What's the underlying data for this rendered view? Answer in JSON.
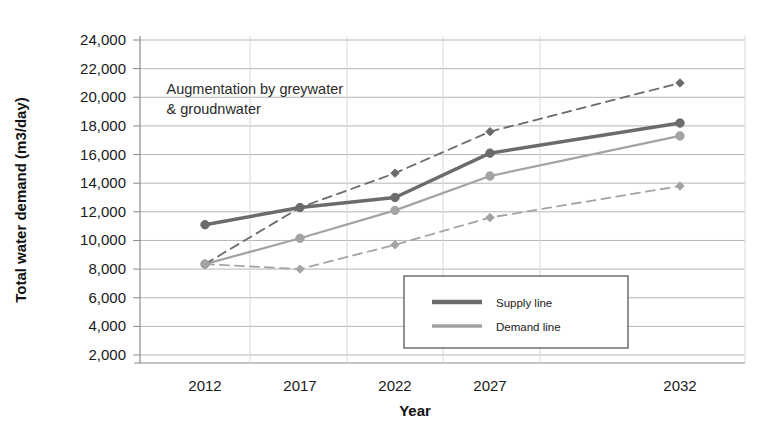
{
  "chart_data": {
    "type": "line",
    "title": "",
    "xlabel": "Year",
    "ylabel": "Total water demand (m3/day)",
    "x": [
      2012,
      2017,
      2022,
      2027,
      2032
    ],
    "categories": [
      "2012",
      "2017",
      "2022",
      "2027",
      "2032"
    ],
    "xtick_labels": [
      "2012",
      "2017",
      "2022",
      "2027",
      "2032"
    ],
    "ytick_labels": [
      "2,000",
      "4,000",
      "6,000",
      "8,000",
      "10,000",
      "12,000",
      "14,000",
      "16,000",
      "18,000",
      "20,000",
      "22,000",
      "24,000"
    ],
    "ytick_values": [
      2000,
      4000,
      6000,
      8000,
      10000,
      12000,
      14000,
      16000,
      18000,
      20000,
      22000,
      24000
    ],
    "ylim": [
      2000,
      24000
    ],
    "xlim": [
      2012,
      2032
    ],
    "grid": true,
    "legend_position": "lower-center",
    "series": [
      {
        "name": "Supply line",
        "style": "solid",
        "color": "#6b6b6b",
        "width": 3.4,
        "values": [
          11100,
          12300,
          13000,
          16100,
          18200
        ]
      },
      {
        "name": "Demand line",
        "style": "solid",
        "color": "#a3a3a3",
        "width": 2.2,
        "values": [
          8350,
          10150,
          12100,
          14500,
          17300
        ]
      },
      {
        "name": "Upper dashed projection",
        "style": "dashed",
        "color": "#6b6b6b",
        "width": 1.8,
        "values": [
          8350,
          12300,
          14700,
          17600,
          21000
        ]
      },
      {
        "name": "Lower dashed projection",
        "style": "dashed",
        "color": "#a3a3a3",
        "width": 1.8,
        "values": [
          8350,
          8000,
          9700,
          11600,
          13800
        ]
      }
    ],
    "annotations": [
      {
        "line1": "Augmentation by greywater",
        "line2": "& groudnwater",
        "x": 2014.2,
        "y": 20200
      }
    ]
  },
  "legend": {
    "items": [
      {
        "label": "Supply line",
        "color": "#6b6b6b"
      },
      {
        "label": "Demand line",
        "color": "#a3a3a3"
      }
    ]
  },
  "colors": {
    "supply": "#6b6b6b",
    "demand": "#a3a3a3",
    "grid": "#b5b5b5",
    "axis": "#8a8a8a",
    "text": "#1a1a1a",
    "background": "#ffffff"
  }
}
